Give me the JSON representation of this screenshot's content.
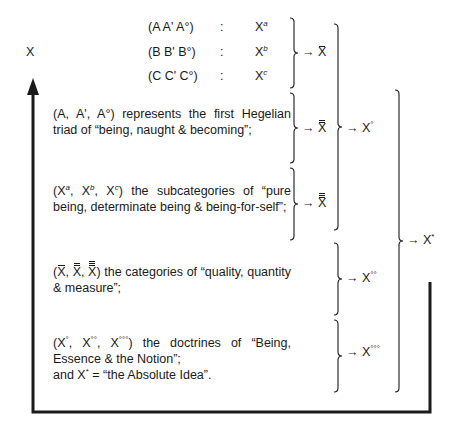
{
  "diagram": {
    "root_label": "X",
    "rows": [
      {
        "triad": "(A  A'  A°)",
        "sep": ":",
        "base": "X",
        "sup": "a"
      },
      {
        "triad": "(B  B'  B°)",
        "sep": ":",
        "base": "X",
        "sup": "b"
      },
      {
        "triad": "(C  C'  C°)",
        "sep": ":",
        "base": "X",
        "sup": "c"
      }
    ],
    "arrow_glyph": "→",
    "results": {
      "x_bar": "X",
      "x_dbar": "X",
      "x_tbar": "X",
      "x_deg": {
        "base": "X",
        "sup": "°"
      },
      "x_deg2": {
        "base": "X",
        "sup": "°°"
      },
      "x_deg3": {
        "base": "X",
        "sup": "°°°"
      },
      "x_star": {
        "base": "X",
        "sup": "*"
      }
    },
    "paragraphs": [
      {
        "text": "(A, A', A°) represents the first Hegelian triad of “being, naught & becoming”;"
      },
      {
        "lead": [
          "(X",
          "a",
          ", X",
          "b",
          ", X",
          "c",
          ")"
        ],
        "text": " the subcategories of “pure being, determinate being & being-for-self”;"
      },
      {
        "lead": [
          "(",
          "X",
          ", ",
          "X",
          ", ",
          "X",
          ")"
        ],
        "text": " the categories of “quality, quantity & measure”;"
      },
      {
        "lead": [
          "(X",
          "°",
          ", X",
          "°°",
          ", X",
          "°°°",
          ")"
        ],
        "text": " the doctrines of “Being, Essence & the Notion”;",
        "line2": "and X",
        "line2_sup": "*",
        "line2_rest": " = “the Absolute Idea”."
      }
    ]
  }
}
